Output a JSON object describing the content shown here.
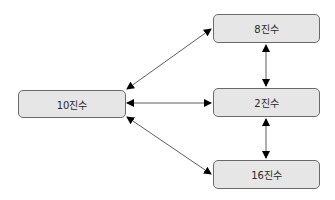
{
  "diagram": {
    "nodes": [
      {
        "id": "decimal",
        "label": "10진수"
      },
      {
        "id": "octal",
        "label": "8진수"
      },
      {
        "id": "binary",
        "label": "2진수"
      },
      {
        "id": "hex",
        "label": "16진수"
      }
    ],
    "edges": [
      {
        "from": "decimal",
        "to": "octal",
        "direction": "both"
      },
      {
        "from": "decimal",
        "to": "binary",
        "direction": "both"
      },
      {
        "from": "decimal",
        "to": "hex",
        "direction": "both"
      },
      {
        "from": "octal",
        "to": "binary",
        "direction": "both"
      },
      {
        "from": "binary",
        "to": "hex",
        "direction": "both"
      }
    ],
    "colors": {
      "node_fill": "#e6e6e6",
      "node_border": "#6a6a6a",
      "arrow": "#000000"
    }
  }
}
